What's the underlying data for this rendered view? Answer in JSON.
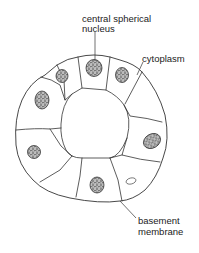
{
  "diagram": {
    "labels": {
      "nucleus_line1": "central spherical",
      "nucleus_line2": "nucleus",
      "cytoplasm": "cytoplasm",
      "membrane_line1": "basement",
      "membrane_line2": "membrane"
    },
    "cell_count": 9,
    "nuclei_count": 8,
    "colors": {
      "line": "#333333",
      "background": "#ffffff",
      "nucleus_fill": "#777777"
    }
  }
}
